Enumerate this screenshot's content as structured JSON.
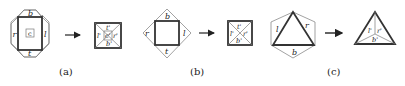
{
  "figure": {
    "panels": [
      {
        "caption": "(a)",
        "left": {
          "top": "b",
          "right_side": "l",
          "bottom": "t",
          "left_side": "r",
          "center": "c"
        },
        "right": {
          "top": "t'",
          "left": "l'",
          "center": "c'",
          "right": "r'",
          "bottom": "b'"
        }
      },
      {
        "caption": "(b)",
        "left": {
          "top": "b",
          "right_side": "l",
          "bottom": "t",
          "left_side": "r"
        },
        "right": {
          "top": "t'",
          "left": "l'",
          "right": "r'",
          "bottom": "b'"
        }
      },
      {
        "caption": "(c)",
        "left": {
          "left_side": "l",
          "right_side": "r",
          "bottom": "b"
        },
        "right": {
          "left": "l'",
          "right": "r'",
          "bottom": "b'"
        }
      }
    ],
    "arrow": "→",
    "colors": {
      "thick_stroke": "#333333",
      "thin_stroke": "#7a7a7a",
      "background": "#ffffff"
    }
  }
}
